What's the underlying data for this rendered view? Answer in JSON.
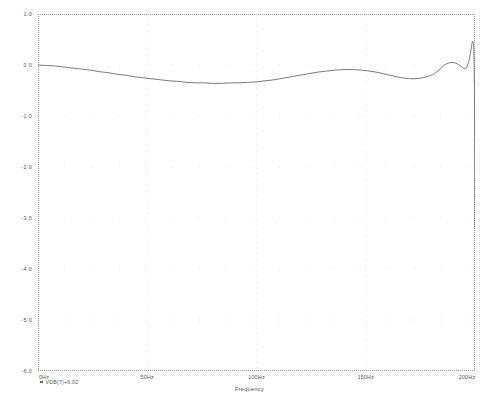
{
  "chart_data": {
    "type": "line",
    "title": "",
    "xlabel": "Frequency",
    "ylabel": "",
    "xlim": [
      0,
      200
    ],
    "ylim": [
      -6.0,
      1.0
    ],
    "grid": true,
    "grid_style": "dotted",
    "legend_position": "below-left",
    "x_unit": "Hz",
    "y_unit": "dB",
    "x_ticks": [
      {
        "value": 0,
        "label": "0Hz"
      },
      {
        "value": 50,
        "label": "50Hz"
      },
      {
        "value": 100,
        "label": "100Hz"
      },
      {
        "value": 150,
        "label": "150Hz"
      },
      {
        "value": 200,
        "label": "200Hz"
      }
    ],
    "y_ticks": [
      {
        "value": 1.0,
        "label": "1.0"
      },
      {
        "value": 0.0,
        "label": "0.0"
      },
      {
        "value": -1.0,
        "label": "-1.0"
      },
      {
        "value": -2.0,
        "label": "-2.0"
      },
      {
        "value": -3.0,
        "label": "-3.0"
      },
      {
        "value": -4.0,
        "label": "-4.0"
      },
      {
        "value": -5.0,
        "label": "-5.0"
      },
      {
        "value": -6.0,
        "label": "-6.0"
      }
    ],
    "series": [
      {
        "name": "VDB(7)+6.02",
        "color": "#6b6b6b",
        "marker": "square",
        "x": [
          0,
          4,
          8,
          12,
          16,
          20,
          24,
          28,
          32,
          36,
          40,
          44,
          48,
          52,
          56,
          60,
          64,
          68,
          72,
          76,
          80,
          84,
          88,
          92,
          96,
          100,
          104,
          108,
          112,
          116,
          120,
          124,
          128,
          132,
          136,
          140,
          144,
          148,
          152,
          156,
          160,
          164,
          168,
          172,
          176,
          180,
          182,
          184,
          186,
          188,
          190,
          192,
          194,
          195,
          196,
          197,
          198,
          198.6,
          199.1,
          199.5,
          199.8,
          200
        ],
        "y": [
          0.0,
          -0.01,
          -0.02,
          -0.04,
          -0.06,
          -0.08,
          -0.1,
          -0.13,
          -0.15,
          -0.18,
          -0.2,
          -0.23,
          -0.25,
          -0.27,
          -0.29,
          -0.31,
          -0.32,
          -0.34,
          -0.35,
          -0.35,
          -0.36,
          -0.36,
          -0.35,
          -0.35,
          -0.34,
          -0.33,
          -0.31,
          -0.29,
          -0.26,
          -0.23,
          -0.2,
          -0.17,
          -0.14,
          -0.12,
          -0.1,
          -0.09,
          -0.09,
          -0.1,
          -0.12,
          -0.15,
          -0.19,
          -0.23,
          -0.26,
          -0.27,
          -0.25,
          -0.2,
          -0.15,
          -0.08,
          0.0,
          0.04,
          0.05,
          0.02,
          -0.04,
          -0.07,
          -0.06,
          0.05,
          0.25,
          0.42,
          0.45,
          0.2,
          -0.8,
          -3.2
        ]
      }
    ]
  },
  "legend": {
    "entries": [
      {
        "label": "VDB(7)+6.02"
      }
    ]
  },
  "axis": {
    "x_title": "Frequency"
  }
}
